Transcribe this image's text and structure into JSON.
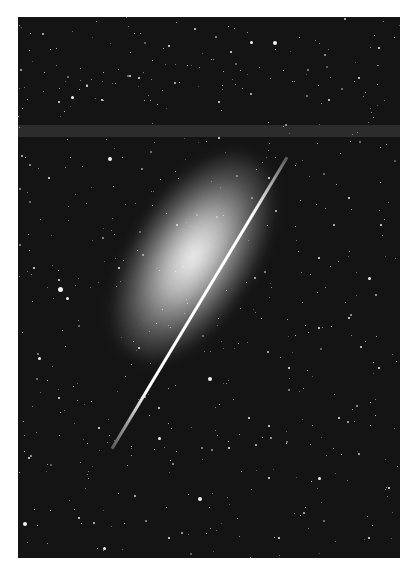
{
  "image": {
    "subject": "edge-on spiral galaxy with bright diagonal streak in a dense star field",
    "style": "black-and-white astronomical photograph",
    "colors": {
      "sky": "#141414",
      "stars": "#f2f2f2",
      "galaxy_core": "#ffffff",
      "border": "#ffffff"
    }
  },
  "stars": [
    [
      232,
      24,
      3
    ],
    [
      255,
      24,
      4
    ],
    [
      150,
      28,
      2
    ],
    [
      212,
      34,
      2
    ],
    [
      53,
      79,
      3
    ],
    [
      40,
      84,
      2
    ],
    [
      68,
      68,
      2
    ],
    [
      83,
      82,
      2
    ],
    [
      200,
      84,
      2
    ],
    [
      310,
      82,
      2
    ],
    [
      340,
      60,
      2
    ],
    [
      360,
      30,
      2
    ],
    [
      90,
      140,
      4
    ],
    [
      30,
      160,
      2
    ],
    [
      250,
      160,
      2
    ],
    [
      330,
      180,
      2
    ],
    [
      15,
      250,
      2
    ],
    [
      40,
      270,
      5
    ],
    [
      48,
      280,
      3
    ],
    [
      300,
      240,
      2
    ],
    [
      350,
      260,
      3
    ],
    [
      20,
      340,
      3
    ],
    [
      300,
      310,
      2
    ],
    [
      360,
      350,
      2
    ],
    [
      190,
      360,
      4
    ],
    [
      230,
      400,
      2
    ],
    [
      140,
      420,
      3
    ],
    [
      80,
      410,
      2
    ],
    [
      320,
      400,
      2
    ],
    [
      10,
      440,
      2
    ],
    [
      180,
      480,
      4
    ],
    [
      5,
      505,
      4
    ],
    [
      60,
      500,
      2
    ],
    [
      250,
      460,
      2
    ],
    [
      300,
      460,
      3
    ],
    [
      370,
      470,
      2
    ],
    [
      120,
      330,
      2
    ],
    [
      270,
      350,
      2
    ],
    [
      100,
      250,
      2
    ],
    [
      40,
      380,
      2
    ],
    [
      210,
      430,
      2
    ],
    [
      350,
      520,
      2
    ],
    [
      150,
      520,
      2
    ],
    [
      85,
      530,
      3
    ],
    [
      260,
      520,
      2
    ],
    [
      330,
      300,
      2
    ],
    [
      200,
      120,
      2
    ],
    [
      120,
      60,
      2
    ]
  ]
}
